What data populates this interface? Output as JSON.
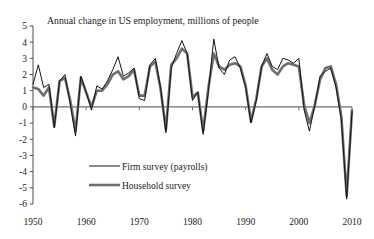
{
  "chart_data": {
    "type": "line",
    "title": "Annual change in US employment, millions of people",
    "xlabel": "",
    "ylabel": "",
    "xlim": [
      1950,
      2010
    ],
    "ylim": [
      -6,
      5
    ],
    "grid": false,
    "legend_position": "center-left-lower",
    "x_ticks": [
      "1950",
      "1960",
      "1970",
      "1980",
      "1990",
      "2000",
      "2010"
    ],
    "x_tick_values": [
      1950,
      1960,
      1970,
      1980,
      1990,
      2000,
      2010
    ],
    "y_ticks": [
      "5",
      "4",
      "3",
      "2",
      "1",
      "0",
      "-1",
      "-2",
      "-3",
      "-4",
      "-5",
      "-6"
    ],
    "y_tick_values": [
      5,
      4,
      3,
      2,
      1,
      0,
      -1,
      -2,
      -3,
      -4,
      -5,
      -6
    ],
    "zero_line": 0,
    "x": [
      1950,
      1951,
      1952,
      1953,
      1954,
      1955,
      1956,
      1957,
      1958,
      1959,
      1960,
      1961,
      1962,
      1963,
      1964,
      1965,
      1966,
      1967,
      1968,
      1969,
      1970,
      1971,
      1972,
      1973,
      1974,
      1975,
      1976,
      1977,
      1978,
      1979,
      1980,
      1981,
      1982,
      1983,
      1984,
      1985,
      1986,
      1987,
      1988,
      1989,
      1990,
      1991,
      1992,
      1993,
      1994,
      1995,
      1996,
      1997,
      1998,
      1999,
      2000,
      2001,
      2002,
      2003,
      2004,
      2005,
      2006,
      2007,
      2008,
      2009,
      2010
    ],
    "series": [
      {
        "name": "Firm survey (payrolls)",
        "color": "#141414",
        "width": 1.0,
        "values": [
          1.4,
          2.6,
          1.2,
          1.4,
          -1.3,
          1.6,
          2.0,
          0.2,
          -1.8,
          1.9,
          0.9,
          -0.2,
          1.3,
          1.1,
          1.6,
          2.3,
          3.1,
          1.9,
          2.1,
          2.4,
          0.5,
          0.4,
          2.6,
          3.0,
          1.2,
          -1.6,
          2.4,
          3.3,
          4.1,
          3.3,
          0.4,
          0.9,
          -1.7,
          1.0,
          4.2,
          2.4,
          2.0,
          2.9,
          3.1,
          2.4,
          1.2,
          -1.0,
          0.4,
          2.5,
          3.3,
          2.5,
          2.3,
          3.0,
          2.9,
          2.7,
          3.0,
          -0.2,
          -1.5,
          0.1,
          1.9,
          2.2,
          2.4,
          1.2,
          -0.8,
          -5.7,
          -0.3
        ]
      },
      {
        "name": "Household survey",
        "color": "#6e6e6e",
        "width": 2.6,
        "values": [
          1.2,
          1.1,
          0.7,
          1.2,
          -1.2,
          1.6,
          1.8,
          0.4,
          -1.5,
          1.8,
          0.9,
          0.0,
          1.0,
          1.0,
          1.4,
          2.0,
          2.2,
          1.7,
          1.9,
          2.3,
          0.7,
          0.7,
          2.5,
          2.8,
          1.1,
          -1.4,
          2.6,
          3.0,
          3.6,
          3.3,
          0.6,
          0.9,
          -1.5,
          1.2,
          3.3,
          2.5,
          2.3,
          2.6,
          2.7,
          2.5,
          1.3,
          -0.9,
          0.5,
          2.5,
          3.0,
          2.3,
          2.0,
          2.5,
          2.7,
          2.6,
          2.5,
          0.1,
          -1.0,
          0.1,
          1.7,
          2.4,
          2.5,
          1.4,
          -0.6,
          -5.5,
          -0.2
        ]
      }
    ],
    "legend": [
      {
        "label": "Firm survey (payrolls)",
        "color": "#141414",
        "width": 1.0
      },
      {
        "label": "Household survey",
        "color": "#6e6e6e",
        "width": 2.6
      }
    ]
  }
}
